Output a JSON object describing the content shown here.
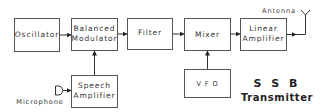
{
  "diagram": {
    "title": {
      "line1": "S S B",
      "line2": "Transmitter"
    },
    "blocks": {
      "oscillator": "Oscillator",
      "balanced_modulator_line1": "Balanced",
      "balanced_modulator_line2": "Modulator",
      "filter": "Filter",
      "mixer": "Mixer",
      "linear_amplifier_line1": "Linear",
      "linear_amplifier_line2": "Amplifier",
      "speech_amplifier_line1": "Speech",
      "speech_amplifier_line2": "Amplifier",
      "vfo": "V F O"
    },
    "labels": {
      "antenna": "Antenna",
      "microphone": "Microphone"
    },
    "colors": {
      "stroke": "#555555",
      "text": "#333333",
      "background": "#ffffff"
    }
  }
}
